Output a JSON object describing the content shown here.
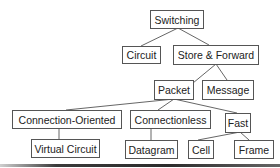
{
  "diagram": {
    "nodes": [
      {
        "id": "switching",
        "label": "Switching"
      },
      {
        "id": "circuit",
        "label": "Circuit"
      },
      {
        "id": "store-forward",
        "label": "Store & Forward"
      },
      {
        "id": "packet",
        "label": "Packet"
      },
      {
        "id": "message",
        "label": "Message"
      },
      {
        "id": "connection-oriented",
        "label": "Connection-Oriented"
      },
      {
        "id": "connectionless",
        "label": "Connectionless"
      },
      {
        "id": "fast",
        "label": "Fast"
      },
      {
        "id": "virtual-circuit",
        "label": "Virtual Circuit"
      },
      {
        "id": "datagram",
        "label": "Datagram"
      },
      {
        "id": "cell",
        "label": "Cell"
      },
      {
        "id": "frame",
        "label": "Frame"
      }
    ],
    "edges": [
      [
        "switching",
        "circuit"
      ],
      [
        "switching",
        "store-forward"
      ],
      [
        "store-forward",
        "packet"
      ],
      [
        "store-forward",
        "message"
      ],
      [
        "packet",
        "connection-oriented"
      ],
      [
        "packet",
        "connectionless"
      ],
      [
        "packet",
        "fast"
      ],
      [
        "connection-oriented",
        "virtual-circuit"
      ],
      [
        "connectionless",
        "datagram"
      ],
      [
        "fast",
        "cell"
      ],
      [
        "fast",
        "frame"
      ]
    ]
  }
}
